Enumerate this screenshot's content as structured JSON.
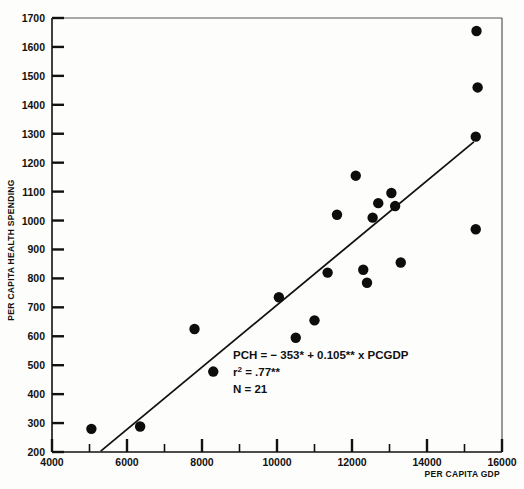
{
  "chart_data": {
    "type": "scatter",
    "title": "",
    "xlabel": "PER CAPITA GDP",
    "ylabel": "PER CAPITA HEALTH SPENDING",
    "xlim": [
      4000,
      16000
    ],
    "ylim": [
      200,
      1700
    ],
    "x_major_ticks": [
      4000,
      6000,
      8000,
      10000,
      12000,
      14000,
      16000
    ],
    "x_major_tick_labels": [
      "4000",
      "6000",
      "8000",
      "10000",
      "12000",
      "14000",
      "16000"
    ],
    "x_minor_ticks": [
      5000,
      7000,
      9000,
      11000,
      13000,
      15000
    ],
    "y_major_ticks": [
      200,
      300,
      400,
      500,
      600,
      700,
      800,
      900,
      1000,
      1100,
      1200,
      1300,
      1400,
      1500,
      1600,
      1700
    ],
    "y_major_tick_labels": [
      "200",
      "300",
      "400",
      "500",
      "600",
      "700",
      "800",
      "900",
      "1000",
      "1100",
      "1200",
      "1300",
      "1400",
      "1500",
      "1600",
      "1700"
    ],
    "grid": false,
    "legend": "none",
    "marker": "filled-circle",
    "n_points": 21,
    "points": [
      {
        "x": 5050,
        "y": 280
      },
      {
        "x": 6350,
        "y": 288
      },
      {
        "x": 7800,
        "y": 625
      },
      {
        "x": 8300,
        "y": 478
      },
      {
        "x": 10050,
        "y": 735
      },
      {
        "x": 10500,
        "y": 595
      },
      {
        "x": 11000,
        "y": 655
      },
      {
        "x": 11350,
        "y": 820
      },
      {
        "x": 11600,
        "y": 1020
      },
      {
        "x": 12100,
        "y": 1155
      },
      {
        "x": 12300,
        "y": 830
      },
      {
        "x": 12400,
        "y": 785
      },
      {
        "x": 12550,
        "y": 1010
      },
      {
        "x": 12700,
        "y": 1060
      },
      {
        "x": 13050,
        "y": 1095
      },
      {
        "x": 13150,
        "y": 1050
      },
      {
        "x": 13300,
        "y": 855
      },
      {
        "x": 15300,
        "y": 1290
      },
      {
        "x": 15300,
        "y": 970
      },
      {
        "x": 15350,
        "y": 1460
      },
      {
        "x": 15320,
        "y": 1655
      }
    ],
    "fit_line": {
      "slope": 0.105,
      "intercept": -353,
      "x_start": 5300,
      "y_start": 203,
      "x_end": 15250,
      "y_end": 1272
    },
    "annotation": {
      "line1_prefix": "PCH = ",
      "line1_intercept": "− 353",
      "line1_star1": "*",
      "line1_plus": " + ",
      "line1_slope": "0.105",
      "line1_star2": "**",
      "line1_suffix": " x PCGDP",
      "line2_label": "r",
      "line2_sup": "2",
      "line2_value": " = .77",
      "line2_star": "**",
      "line3": "N = 21",
      "full_line1": "PCH = − 353* + 0.105** x PCGDP",
      "full_line2": "r² = .77**",
      "full_line3": "N = 21"
    },
    "colors": {
      "marker": "#0d0d0d",
      "line": "#111111",
      "axis": "#111111",
      "background": "#fdfdfb"
    }
  }
}
